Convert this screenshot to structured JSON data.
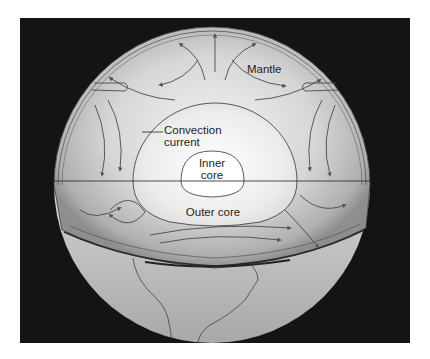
{
  "diagram": {
    "labels": {
      "mantle": "Mantle",
      "convection_line1": "Convection",
      "convection_line2": "current",
      "inner_core_line1": "Inner",
      "inner_core_line2": "core",
      "outer_core": "Outer core"
    },
    "colors": {
      "background": "#141414",
      "page": "#ffffff",
      "sphere_light": "#e8e8e8",
      "sphere_mid": "#c4c4c4",
      "sphere_dark": "#8a8a8a",
      "line": "#3a3a3a"
    }
  }
}
